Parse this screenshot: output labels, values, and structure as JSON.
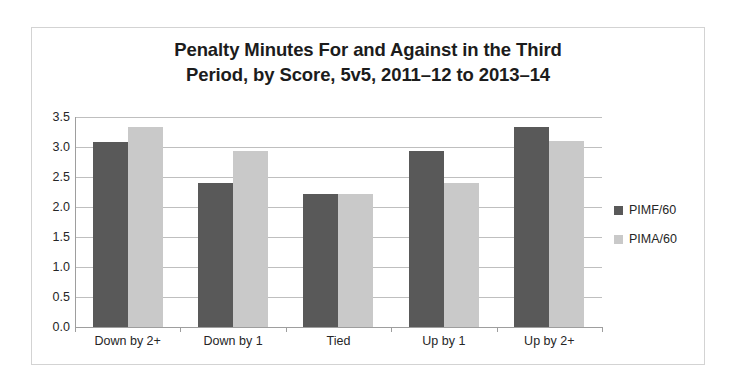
{
  "chart_data": {
    "type": "bar",
    "title": "Penalty Minutes For and Against in the Third Period, by Score, 5v5, 2011–12 to 2013–14",
    "title_lines": [
      "Penalty Minutes For and Against in the Third",
      "Period, by Score, 5v5, 2011–12 to 2013–14"
    ],
    "xlabel": "",
    "ylabel": "",
    "categories": [
      "Down by 2+",
      "Down by 1",
      "Tied",
      "Up by 1",
      "Up by 2+"
    ],
    "series": [
      {
        "name": "PIMF/60",
        "color": "#595959",
        "values": [
          3.08,
          2.4,
          2.22,
          2.93,
          3.33
        ]
      },
      {
        "name": "PIMA/60",
        "color": "#c9c9c9",
        "values": [
          3.33,
          2.93,
          2.22,
          2.4,
          3.1
        ]
      }
    ],
    "ylim": [
      0.0,
      3.5
    ],
    "ytick_labels": [
      "3.5",
      "3.0",
      "2.5",
      "2.0",
      "1.5",
      "1.0",
      "0.5",
      "0.0"
    ],
    "ytick_values": [
      3.5,
      3.0,
      2.5,
      2.0,
      1.5,
      1.0,
      0.5,
      0.0
    ],
    "grid": true,
    "legend_position": "right",
    "plot_background": "#ffffff",
    "gridline_color": "#bfbfbf",
    "axis_color": "#9e9e9e",
    "border_color": "#d3d3d3",
    "text_color": "#262626",
    "title_color": "#1c1c1c"
  }
}
